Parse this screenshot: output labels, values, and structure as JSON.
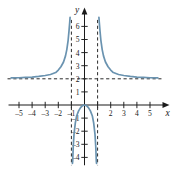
{
  "figure": {
    "background": "#ffffff",
    "curve_color": "#6a93b0",
    "axis_color": "#1b1b1b",
    "asymptote_color": "#2b2b2b",
    "x_axis_label": "x",
    "y_axis_label": "y"
  },
  "chart_data": {
    "type": "line",
    "title": "",
    "xlabel": "x",
    "ylabel": "y",
    "xlim": [
      -5.8,
      5.8
    ],
    "ylim": [
      -4.6,
      6.8
    ],
    "grid": false,
    "legend": "none",
    "x_ticks": [
      -5,
      -4,
      -3,
      -2,
      -1,
      1,
      2,
      3,
      4,
      5
    ],
    "x_tick_labels": [
      "-5",
      "-4",
      "-3",
      "-2",
      "-1",
      "",
      "2",
      "3",
      "4",
      "5"
    ],
    "y_ticks": [
      -4,
      -3,
      -2,
      -1,
      1,
      2,
      3,
      4,
      5,
      6
    ],
    "y_tick_labels": [
      "-4",
      "-3",
      "-2",
      "-1",
      "1",
      "2",
      "3",
      "4",
      "5",
      "6"
    ],
    "function": "y = 2x^2 / (x^2 - 1)",
    "asymptotes": {
      "vertical": [
        -1,
        1
      ],
      "horizontal": [
        2
      ],
      "style": "dashed"
    },
    "branches": [
      {
        "name": "left-branch",
        "domain": [
          -5.6,
          -1.04
        ],
        "points": [
          [
            -5.6,
            2.07
          ],
          [
            -5.0,
            2.08
          ],
          [
            -4.5,
            2.11
          ],
          [
            -4.0,
            2.13
          ],
          [
            -3.5,
            2.18
          ],
          [
            -3.0,
            2.25
          ],
          [
            -2.6,
            2.33
          ],
          [
            -2.2,
            2.48
          ],
          [
            -2.0,
            2.67
          ],
          [
            -1.8,
            2.92
          ],
          [
            -1.6,
            3.28
          ],
          [
            -1.45,
            3.75
          ],
          [
            -1.35,
            4.23
          ],
          [
            -1.25,
            4.94
          ],
          [
            -1.18,
            5.68
          ],
          [
            -1.13,
            6.3
          ],
          [
            -1.1,
            6.7
          ]
        ]
      },
      {
        "name": "middle-branch",
        "domain": [
          -0.92,
          0.92
        ],
        "points": [
          [
            -0.92,
            -4.45
          ],
          [
            -0.9,
            -4.26
          ],
          [
            -0.86,
            -3.19
          ],
          [
            -0.8,
            -2.22
          ],
          [
            -0.7,
            -1.37
          ],
          [
            -0.6,
            -0.84
          ],
          [
            -0.45,
            -0.45
          ],
          [
            -0.3,
            -0.2
          ],
          [
            -0.15,
            -0.05
          ],
          [
            0.0,
            0.0
          ],
          [
            0.15,
            -0.05
          ],
          [
            0.3,
            -0.2
          ],
          [
            0.45,
            -0.45
          ],
          [
            0.6,
            -0.84
          ],
          [
            0.7,
            -1.37
          ],
          [
            0.8,
            -2.22
          ],
          [
            0.86,
            -3.19
          ],
          [
            0.9,
            -4.26
          ],
          [
            0.92,
            -4.45
          ]
        ]
      },
      {
        "name": "right-branch",
        "domain": [
          1.04,
          5.6
        ],
        "points": [
          [
            1.1,
            6.7
          ],
          [
            1.13,
            6.3
          ],
          [
            1.18,
            5.68
          ],
          [
            1.25,
            4.94
          ],
          [
            1.35,
            4.23
          ],
          [
            1.45,
            3.75
          ],
          [
            1.6,
            3.28
          ],
          [
            1.8,
            2.92
          ],
          [
            2.0,
            2.67
          ],
          [
            2.2,
            2.48
          ],
          [
            2.6,
            2.33
          ],
          [
            3.0,
            2.25
          ],
          [
            3.5,
            2.18
          ],
          [
            4.0,
            2.13
          ],
          [
            4.5,
            2.11
          ],
          [
            5.0,
            2.08
          ],
          [
            5.6,
            2.07
          ]
        ]
      }
    ]
  }
}
